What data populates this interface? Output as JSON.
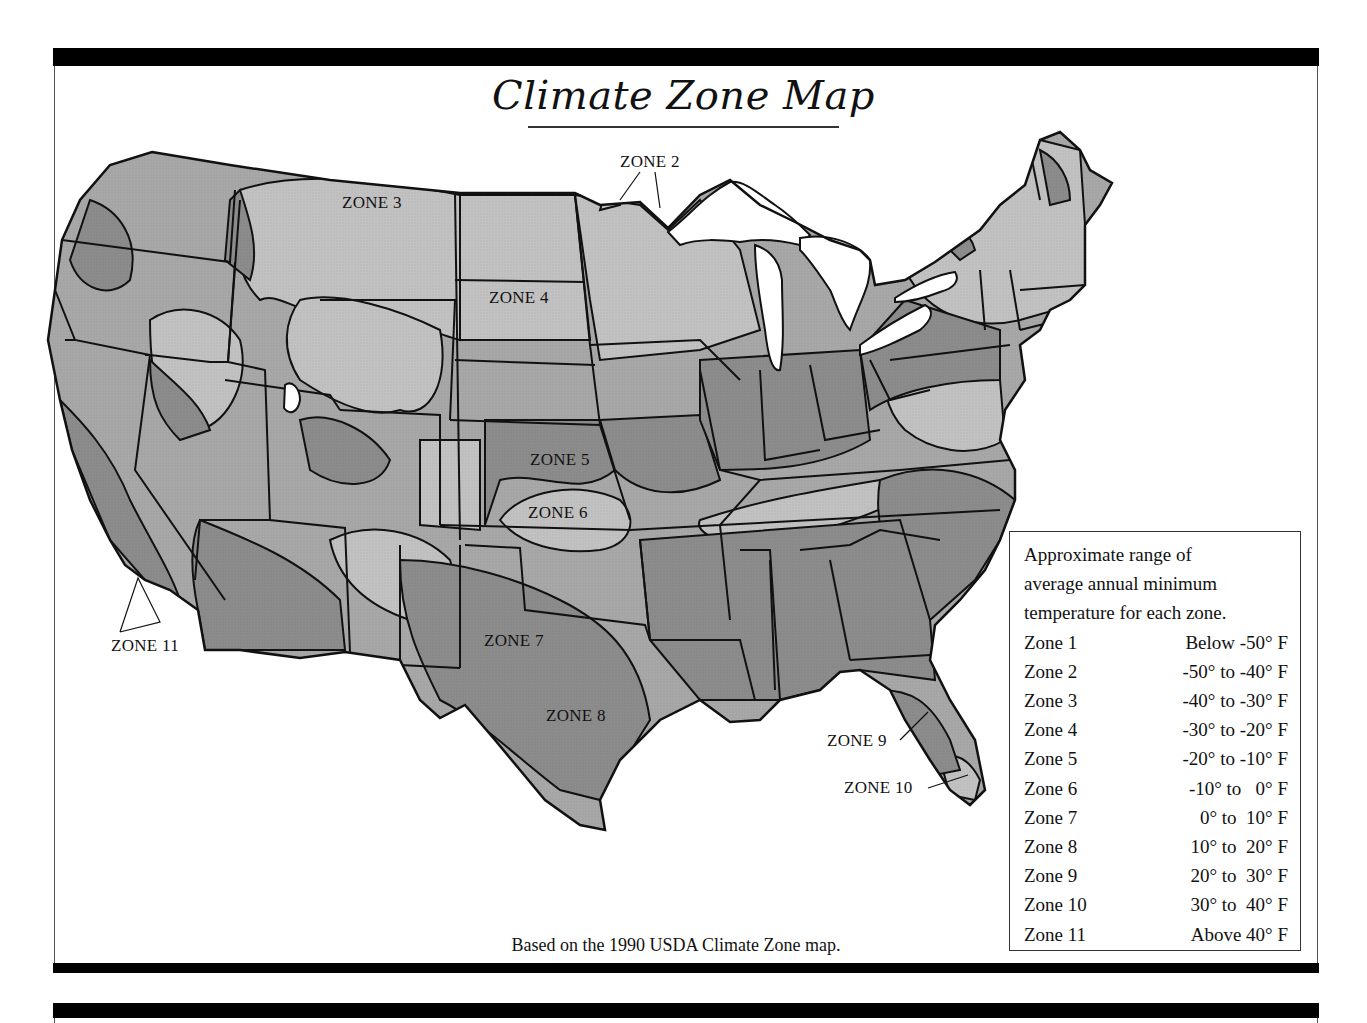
{
  "title": "Climate Zone Map",
  "caption": "Based on the 1990 USDA Climate Zone map.",
  "colors": {
    "frame_bar": "#000000",
    "zone_dark_fill": "#8c8c8c",
    "zone_light_fill": "#c2c2c2",
    "zone_mid_fill": "#a8a8a8",
    "water_fill": "#ffffff",
    "outline": "#111111"
  },
  "map_labels": [
    {
      "id": "zone2",
      "text": "ZONE 2"
    },
    {
      "id": "zone3",
      "text": "ZONE 3"
    },
    {
      "id": "zone4",
      "text": "ZONE 4"
    },
    {
      "id": "zone5",
      "text": "ZONE 5"
    },
    {
      "id": "zone6",
      "text": "ZONE 6"
    },
    {
      "id": "zone7",
      "text": "ZONE 7"
    },
    {
      "id": "zone8",
      "text": "ZONE 8"
    },
    {
      "id": "zone9",
      "text": "ZONE 9"
    },
    {
      "id": "zone10",
      "text": "ZONE 10"
    },
    {
      "id": "zone11",
      "text": "ZONE 11"
    }
  ],
  "legend": {
    "intro_lines": [
      "Approximate range of",
      "average annual minimum",
      "temperature for each zone."
    ],
    "rows": [
      {
        "zone": "Zone 1",
        "range": "Below -50° F"
      },
      {
        "zone": "Zone 2",
        "range": "-50° to -40° F"
      },
      {
        "zone": "Zone 3",
        "range": "-40° to -30° F"
      },
      {
        "zone": "Zone 4",
        "range": "-30° to -20° F"
      },
      {
        "zone": "Zone 5",
        "range": "-20° to -10° F"
      },
      {
        "zone": "Zone 6",
        "range": "-10° to   0° F"
      },
      {
        "zone": "Zone 7",
        "range": "0° to  10° F"
      },
      {
        "zone": "Zone 8",
        "range": "10° to  20° F"
      },
      {
        "zone": "Zone 9",
        "range": "20° to  30° F"
      },
      {
        "zone": "Zone 10",
        "range": "30° to  40° F"
      },
      {
        "zone": "Zone 11",
        "range": "Above 40° F"
      }
    ]
  }
}
